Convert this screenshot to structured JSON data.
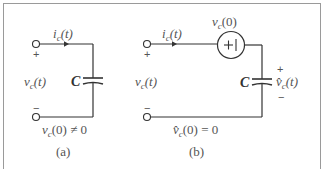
{
  "figure": {
    "panel_a": {
      "caption": "(a)",
      "current_label_i": "i",
      "current_label_sub": "c",
      "current_label_arg": "(t)",
      "voltage_label_v": "v",
      "voltage_label_sub": "c",
      "voltage_label_arg": "(t)",
      "plus_sign": "+",
      "minus_sign": "−",
      "capacitor_label": "C",
      "initial_condition_v": "v",
      "initial_condition_sub": "c",
      "initial_condition_rest": "(0) ≠ 0"
    },
    "panel_b": {
      "caption": "(b)",
      "current_label_i": "i",
      "current_label_sub": "c",
      "current_label_arg": "(t)",
      "voltage_label_v": "v",
      "voltage_label_sub": "c",
      "voltage_label_arg": "(t)",
      "plus_sign": "+",
      "minus_sign": "−",
      "source_label_v": "v",
      "source_label_sub": "c",
      "source_label_arg": "(0)",
      "source_symbol": "+|",
      "capacitor_label": "C",
      "cap_voltage_v": "v̂",
      "cap_voltage_sub": "c",
      "cap_voltage_arg": "(t)",
      "cap_plus": "+",
      "cap_minus": "−",
      "initial_condition_v": "v̂",
      "initial_condition_sub": "c",
      "initial_condition_rest": "(0) = 0"
    },
    "colors": {
      "wire": "#333333",
      "text": "#555555",
      "frame": "#9a9a9a"
    }
  }
}
